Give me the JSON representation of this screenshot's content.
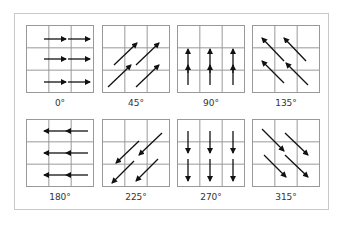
{
  "figure": {
    "panels": [
      {
        "label": "0°",
        "angle": 0
      },
      {
        "label": "45°",
        "angle": 45
      },
      {
        "label": "90°",
        "angle": 90
      },
      {
        "label": "135°",
        "angle": 135
      },
      {
        "label": "180°",
        "angle": 180
      },
      {
        "label": "225°",
        "angle": 225
      },
      {
        "label": "270°",
        "angle": 270
      },
      {
        "label": "315°",
        "angle": 315
      }
    ],
    "grid": {
      "rows": 3,
      "cols": 3,
      "line_color": "#999999",
      "arrow_color": "#111111"
    }
  }
}
